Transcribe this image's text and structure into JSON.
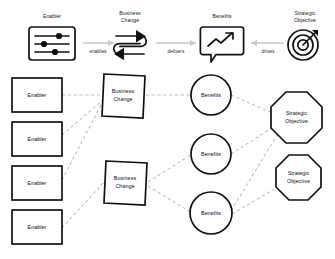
{
  "diagram": {
    "background_color": "#ffffff",
    "node_stroke_color": "#111111",
    "link_color": "#bdbdbd",
    "arrow_color": "#c9c9c9"
  },
  "legend": {
    "items": [
      {
        "id": "enabler",
        "label_line1": "Enabler",
        "label_line2": "",
        "icon": "sliders-settings-icon"
      },
      {
        "id": "business-change",
        "label_line1": "Business",
        "label_line2": "Change",
        "icon": "two-way-circular-arrows-icon"
      },
      {
        "id": "benefits",
        "label_line1": "Benefits",
        "label_line2": "",
        "icon": "speech-bubble-trend-arrow-icon"
      },
      {
        "id": "strategic-objective",
        "label_line1": "Strategic",
        "label_line2": "Objective",
        "icon": "target-bullseye-dart-icon"
      }
    ],
    "connectors": [
      {
        "id": "enables",
        "label": "enables",
        "direction": "right"
      },
      {
        "id": "delivers",
        "label": "delivers",
        "direction": "right"
      },
      {
        "id": "drives",
        "label": "drives",
        "direction": "left"
      }
    ]
  },
  "network": {
    "columns": [
      {
        "id": "enablers",
        "shape": "rectangle",
        "nodes": [
          {
            "id": "enabler-1",
            "label": "Enabler"
          },
          {
            "id": "enabler-2",
            "label": "Enabler"
          },
          {
            "id": "enabler-3",
            "label": "Enabler"
          },
          {
            "id": "enabler-4",
            "label": "Enabler"
          }
        ]
      },
      {
        "id": "business-changes",
        "shape": "parallelogram",
        "nodes": [
          {
            "id": "business-change-1",
            "label_line1": "Business",
            "label_line2": "Change"
          },
          {
            "id": "business-change-2",
            "label_line1": "Business",
            "label_line2": "Change"
          }
        ]
      },
      {
        "id": "benefits",
        "shape": "circle",
        "nodes": [
          {
            "id": "benefit-1",
            "label": "Benefits"
          },
          {
            "id": "benefit-2",
            "label": "Benefits"
          },
          {
            "id": "benefit-3",
            "label": "Benefits"
          }
        ]
      },
      {
        "id": "strategic-objectives",
        "shape": "octagon",
        "nodes": [
          {
            "id": "strategic-objective-1",
            "label_line1": "Strategic",
            "label_line2": "Objective"
          },
          {
            "id": "strategic-objective-2",
            "label_line1": "Strategic",
            "label_line2": "Objective"
          }
        ]
      }
    ],
    "links": [
      {
        "from": "enabler-1",
        "to": "business-change-1"
      },
      {
        "from": "enabler-2",
        "to": "business-change-1"
      },
      {
        "from": "enabler-3",
        "to": "business-change-1"
      },
      {
        "from": "enabler-4",
        "to": "business-change-2"
      },
      {
        "from": "business-change-1",
        "to": "benefit-1"
      },
      {
        "from": "business-change-2",
        "to": "benefit-2"
      },
      {
        "from": "business-change-2",
        "to": "benefit-3"
      },
      {
        "from": "benefit-1",
        "to": "strategic-objective-1"
      },
      {
        "from": "benefit-2",
        "to": "strategic-objective-1"
      },
      {
        "from": "benefit-3",
        "to": "strategic-objective-1"
      },
      {
        "from": "benefit-3",
        "to": "strategic-objective-2"
      }
    ]
  }
}
